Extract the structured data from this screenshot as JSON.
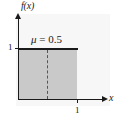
{
  "figure": {
    "axes": {
      "y_axis_label": "f(x)",
      "x_axis_label": "x",
      "y_tick_label": "1",
      "x_tick_label": "1"
    },
    "annotation": {
      "symbol": "μ",
      "equals_value": " = 0.5",
      "full_text": "μ = 0.5"
    },
    "colors": {
      "fill": "#c9c9c9",
      "line": "#1a1a1a",
      "dashed": "#555555",
      "panel": "#f7f7f7",
      "background": "#ffffff"
    }
  },
  "chart_data": {
    "type": "area",
    "title": "",
    "subtitle": "",
    "xlabel": "x",
    "ylabel": "f(x)",
    "xlim": [
      0,
      1.45
    ],
    "ylim": [
      0,
      1.65
    ],
    "grid": false,
    "legend": "none",
    "x_ticks": [
      1
    ],
    "x_tick_labels": [
      "1"
    ],
    "y_ticks": [
      1
    ],
    "y_tick_labels": [
      "1"
    ],
    "series": [
      {
        "name": "f(x)",
        "kind": "uniform-pdf",
        "x": [
          0,
          1
        ],
        "values": [
          1,
          1
        ],
        "filled": true,
        "fill_color": "#c9c9c9",
        "line_color": "#1a1a1a"
      }
    ],
    "annotations": [
      {
        "name": "mean-marker",
        "text": "μ = 0.5",
        "x": 0.5,
        "style": "vertical-dashed-line"
      }
    ]
  }
}
